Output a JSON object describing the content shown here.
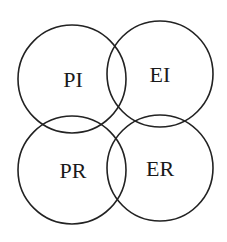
{
  "diagram": {
    "type": "four-circle overlapping venn",
    "stroke_color": "#222222",
    "background": "#ffffff",
    "circles": [
      {
        "label": "PI",
        "cx": 72,
        "cy": 79,
        "r": 54
      },
      {
        "label": "EI",
        "cx": 160,
        "cy": 74,
        "r": 53
      },
      {
        "label": "PR",
        "cx": 72,
        "cy": 170,
        "r": 54
      },
      {
        "label": "ER",
        "cx": 160,
        "cy": 168,
        "r": 53
      }
    ]
  }
}
